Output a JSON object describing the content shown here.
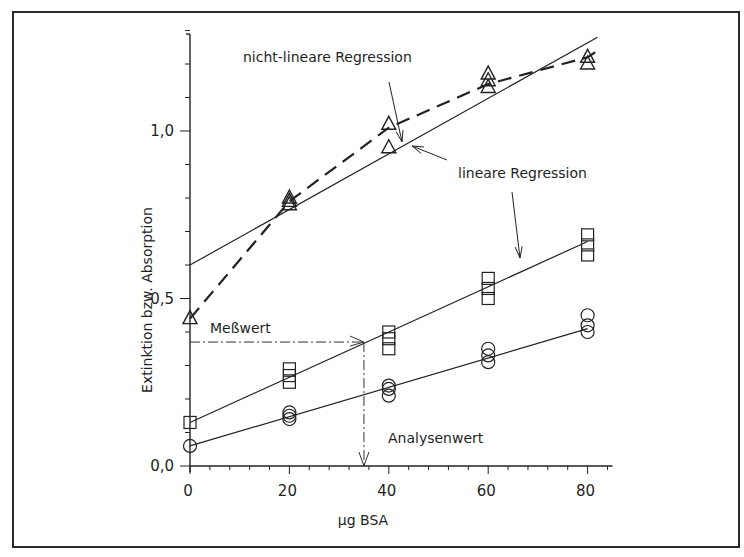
{
  "chart_data": {
    "type": "scatter",
    "title": "",
    "xlabel": "µg BSA",
    "ylabel": "Extinktion bzw. Absorption",
    "xlim": [
      0,
      85
    ],
    "ylim": [
      0,
      1.3
    ],
    "x_ticks": [
      0,
      20,
      40,
      60,
      80
    ],
    "x_tick_labels": [
      "0",
      "20",
      "40",
      "60",
      "80"
    ],
    "y_ticks": [
      0.0,
      0.5,
      1.0
    ],
    "y_tick_labels": [
      "0,0",
      "0,5",
      "1,0"
    ],
    "grid": false,
    "legend": null,
    "series": [
      {
        "name": "Triangles",
        "marker": "triangle",
        "points": [
          [
            0,
            0.44
          ],
          [
            20,
            0.78
          ],
          [
            20,
            0.79
          ],
          [
            20,
            0.8
          ],
          [
            40,
            0.95
          ],
          [
            40,
            1.02
          ],
          [
            60,
            1.13
          ],
          [
            60,
            1.15
          ],
          [
            60,
            1.17
          ],
          [
            80,
            1.2
          ],
          [
            80,
            1.22
          ]
        ]
      },
      {
        "name": "Squares",
        "marker": "square",
        "points": [
          [
            0,
            0.13
          ],
          [
            20,
            0.25
          ],
          [
            20,
            0.27
          ],
          [
            20,
            0.29
          ],
          [
            40,
            0.35
          ],
          [
            40,
            0.38
          ],
          [
            40,
            0.4
          ],
          [
            60,
            0.5
          ],
          [
            60,
            0.53
          ],
          [
            60,
            0.56
          ],
          [
            80,
            0.63
          ],
          [
            80,
            0.66
          ],
          [
            80,
            0.69
          ]
        ]
      },
      {
        "name": "Circles",
        "marker": "circle",
        "points": [
          [
            0,
            0.06
          ],
          [
            20,
            0.14
          ],
          [
            20,
            0.15
          ],
          [
            20,
            0.16
          ],
          [
            40,
            0.21
          ],
          [
            40,
            0.23
          ],
          [
            40,
            0.24
          ],
          [
            60,
            0.31
          ],
          [
            60,
            0.33
          ],
          [
            60,
            0.35
          ],
          [
            80,
            0.4
          ],
          [
            80,
            0.42
          ],
          [
            80,
            0.45
          ]
        ]
      }
    ],
    "fits": [
      {
        "name": "lineare Regression (Triangles)",
        "style": "solid",
        "x": [
          0,
          82
        ],
        "y": [
          0.6,
          1.28
        ]
      },
      {
        "name": "nicht-lineare Regression (Triangles)",
        "style": "dashed",
        "x": [
          0,
          20,
          40,
          60,
          80,
          82
        ],
        "y": [
          0.44,
          0.79,
          1.01,
          1.14,
          1.22,
          1.24
        ]
      },
      {
        "name": "lineare Regression (Squares)",
        "style": "solid",
        "x": [
          0,
          80
        ],
        "y": [
          0.13,
          0.67
        ]
      },
      {
        "name": "lineare Regression (Circles)",
        "style": "solid",
        "x": [
          0,
          80
        ],
        "y": [
          0.06,
          0.41
        ]
      }
    ],
    "annotations": [
      {
        "text": "nicht-lineare Regression",
        "points_to": "dashed curve near x=43"
      },
      {
        "text": "lineare Regression",
        "points_to": [
          "solid triangle line near x=45",
          "square regression line near x=66"
        ]
      },
      {
        "text": "Meßwert",
        "value_y": 0.37,
        "style": "dash-dot horizontal to square regression line"
      },
      {
        "text": "Analysenwert",
        "value_x": 35,
        "style": "dash-dot vertical down to x-axis"
      }
    ]
  },
  "labels": {
    "x_axis_title": "µg BSA",
    "y_axis_title": "Extinktion bzw. Absorption",
    "ann_nonlinear": "nicht-lineare Regression",
    "ann_linear": "lineare Regression",
    "ann_messwert": "Meßwert",
    "ann_analysenwert": "Analysenwert"
  }
}
